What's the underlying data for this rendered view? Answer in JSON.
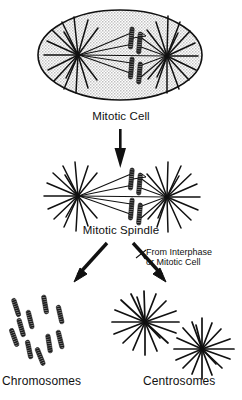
{
  "figure": {
    "background_color": "#ffffff",
    "ink_color": "#111111",
    "cell_fill_color": "#d8d8d8"
  },
  "labels": {
    "mitotic_cell": "Mitotic Cell",
    "mitotic_spindle": "Mitotic Spindle",
    "source_line1": "From Interphase",
    "source_line2": "or Mitotic Cell",
    "chromosomes": "Chromosomes",
    "centrosomes": "Centrosomes"
  },
  "stages": [
    {
      "id": "mitotic-cell",
      "label": "Mitotic Cell",
      "shape": "ellipse",
      "asters": 2,
      "chromosomes_at_plate": 4
    },
    {
      "id": "mitotic-spindle",
      "label": "Mitotic Spindle",
      "shape": "isolated-spindle",
      "asters": 2,
      "chromosomes_at_plate": 4
    },
    {
      "id": "chromosomes",
      "label": "Chromosomes",
      "shape": "scattered-rods",
      "count": 10
    },
    {
      "id": "centrosomes",
      "label": "Centrosomes",
      "shape": "asters",
      "count": 2
    }
  ],
  "arrows": [
    {
      "id": "cell-to-spindle",
      "direction": "down",
      "label": ""
    },
    {
      "id": "spindle-to-chromosomes",
      "direction": "down-left",
      "label": ""
    },
    {
      "id": "spindle-to-centrosomes",
      "direction": "down-right",
      "label": "From Interphase or Mitotic Cell"
    }
  ],
  "chromosome_positions": [
    {
      "x": 14,
      "y": 307,
      "rot": -18
    },
    {
      "x": 27,
      "y": 316,
      "rot": -16
    },
    {
      "x": 42,
      "y": 305,
      "rot": -12
    },
    {
      "x": 57,
      "y": 313,
      "rot": -14
    },
    {
      "x": 12,
      "y": 334,
      "rot": -20
    },
    {
      "x": 26,
      "y": 344,
      "rot": -12
    },
    {
      "x": 38,
      "y": 351,
      "rot": -22
    },
    {
      "x": 46,
      "y": 340,
      "rot": -10
    },
    {
      "x": 57,
      "y": 335,
      "rot": -14
    },
    {
      "x": 20,
      "y": 325,
      "rot": -15
    }
  ]
}
